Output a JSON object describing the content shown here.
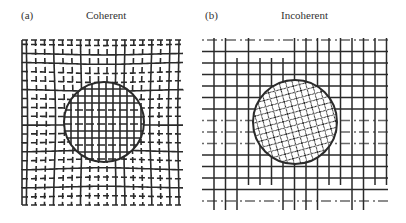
{
  "panels": [
    {
      "id": "a",
      "letter": "(a)",
      "title": "Coherent",
      "grid": {
        "x0": 22,
        "y0": 40,
        "x1": 183,
        "y1": 205,
        "spacing": 8.5
      },
      "circle": {
        "cx": 104,
        "cy": 122,
        "r": 40
      },
      "inner_pattern": "square-grid",
      "description": "Grid lines bend around circular inclusion, continuous across boundary"
    },
    {
      "id": "b",
      "letter": "(b)",
      "title": "Incoherent",
      "grid": {
        "x0": 202,
        "y0": 38,
        "x1": 388,
        "y1": 210,
        "spacing": 11.5
      },
      "circle": {
        "cx": 295,
        "cy": 122,
        "r": 42
      },
      "inner_pattern": "diamond-crosshatch",
      "description": "Straight grid lines with circular inclusion having a distinct rotated lattice"
    }
  ],
  "colors": {
    "line": "#2a2a2a",
    "background": "#ffffff"
  }
}
